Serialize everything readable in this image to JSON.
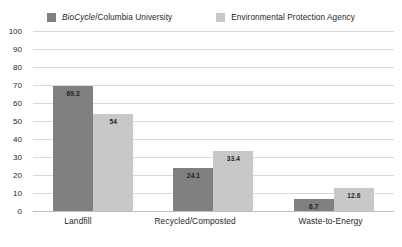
{
  "chart_data": {
    "type": "bar",
    "title": "",
    "subtitle": "",
    "xlabel": "",
    "ylabel": "",
    "categories": [
      "Landfill",
      "Recycled/Composted",
      "Waste-to-Energy"
    ],
    "series": [
      {
        "name": "BioCycle/Columbia University",
        "name_italic_part": "BioCycle",
        "name_rest": "/Columbia University",
        "color": "#808080",
        "values": [
          69.3,
          24.1,
          6.7
        ],
        "value_labels": [
          "69.3",
          "24.1",
          "6.7"
        ]
      },
      {
        "name": "Environmental Protection Agency",
        "color": "#c8c8c8",
        "values": [
          54,
          33.4,
          12.6
        ],
        "value_labels": [
          "54",
          "33.4",
          "12.6"
        ]
      }
    ],
    "ylim": [
      0,
      100
    ],
    "yticks": [
      100,
      90,
      80,
      70,
      60,
      50,
      40,
      30,
      20,
      10,
      0
    ],
    "ytick_labels": [
      "100",
      "90",
      "80",
      "70",
      "60",
      "50",
      "40",
      "30",
      "20",
      "10",
      "0"
    ],
    "grid": "horizontal",
    "legend_position": "top"
  }
}
